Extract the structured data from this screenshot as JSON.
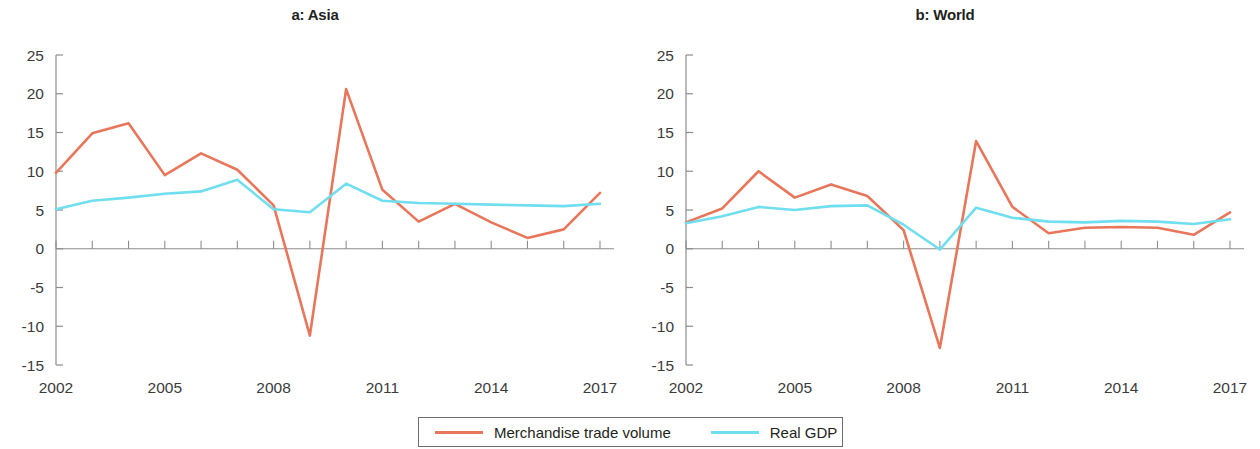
{
  "figure": {
    "panels": [
      {
        "id": "a",
        "title": "a: Asia"
      },
      {
        "id": "b",
        "title": "b: World"
      }
    ]
  },
  "legend": {
    "entries": [
      {
        "label": "Merchandise trade volume",
        "color": "#e8765a"
      },
      {
        "label": "Real GDP",
        "color": "#6fdeef"
      }
    ]
  },
  "axis": {
    "y_ticks": [
      "25",
      "20",
      "15",
      "10",
      "5",
      "0",
      "-5",
      "-10",
      "-15"
    ],
    "x_ticks": [
      "2002",
      "2005",
      "2008",
      "2011",
      "2014",
      "2017"
    ]
  },
  "chart_data": [
    {
      "type": "line",
      "title": "a: Asia",
      "xlabel": "",
      "ylabel": "",
      "x": [
        2002,
        2003,
        2004,
        2005,
        2006,
        2007,
        2008,
        2009,
        2010,
        2011,
        2012,
        2013,
        2014,
        2015,
        2016,
        2017
      ],
      "xlim": [
        2002,
        2017
      ],
      "ylim": [
        -15,
        25
      ],
      "ytick_values": [
        25,
        20,
        15,
        10,
        5,
        0,
        -5,
        -10,
        -15
      ],
      "xtick_values": [
        2002,
        2005,
        2008,
        2011,
        2014,
        2017
      ],
      "grid": false,
      "legend_position": "bottom",
      "series": [
        {
          "name": "Merchandise trade volume",
          "color": "#e8765a",
          "values": [
            9.8,
            14.9,
            16.2,
            9.5,
            12.3,
            10.2,
            5.6,
            -11.2,
            20.6,
            7.6,
            3.5,
            5.8,
            3.4,
            1.4,
            2.5,
            7.2
          ]
        },
        {
          "name": "Real GDP",
          "color": "#6fdeef",
          "values": [
            5.1,
            6.2,
            6.6,
            7.1,
            7.4,
            8.9,
            5.1,
            4.7,
            8.4,
            6.2,
            5.9,
            5.8,
            5.7,
            5.6,
            5.5,
            5.8
          ]
        }
      ]
    },
    {
      "type": "line",
      "title": "b: World",
      "xlabel": "",
      "ylabel": "",
      "x": [
        2002,
        2003,
        2004,
        2005,
        2006,
        2007,
        2008,
        2009,
        2010,
        2011,
        2012,
        2013,
        2014,
        2015,
        2016,
        2017
      ],
      "xlim": [
        2002,
        2017
      ],
      "ylim": [
        -15,
        25
      ],
      "ytick_values": [
        25,
        20,
        15,
        10,
        5,
        0,
        -5,
        -10,
        -15
      ],
      "xtick_values": [
        2002,
        2005,
        2008,
        2011,
        2014,
        2017
      ],
      "grid": false,
      "legend_position": "bottom",
      "series": [
        {
          "name": "Merchandise trade volume",
          "color": "#e8765a",
          "values": [
            3.4,
            5.2,
            10.0,
            6.6,
            8.3,
            6.8,
            2.4,
            -12.8,
            13.9,
            5.4,
            2.0,
            2.7,
            2.8,
            2.7,
            1.8,
            4.7
          ]
        },
        {
          "name": "Real GDP",
          "color": "#6fdeef",
          "values": [
            3.3,
            4.2,
            5.4,
            5.0,
            5.5,
            5.6,
            3.1,
            -0.1,
            5.3,
            4.0,
            3.5,
            3.4,
            3.6,
            3.5,
            3.2,
            3.8
          ]
        }
      ]
    }
  ]
}
